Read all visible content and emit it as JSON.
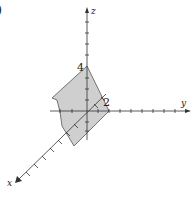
{
  "figure": {
    "partial_label": ")",
    "shape_fill": "#cfcfcf",
    "shape_stroke": "#555555",
    "axis_color": "#333333",
    "axes": {
      "x": {
        "label": "x"
      },
      "y": {
        "label": "y"
      },
      "z": {
        "label": "z"
      }
    },
    "annotations": {
      "z_intercept": "4",
      "y_intercept": "2"
    },
    "shape": {
      "description": "Shaded planar region in first octant-style 3D plot, vertices on z-axis at 4 and y-axis at 2",
      "vertices_px": [
        [
          87,
          66
        ],
        [
          52,
          98
        ],
        [
          57,
          100
        ],
        [
          60,
          112
        ],
        [
          62,
          126
        ],
        [
          74,
          146
        ],
        [
          109,
          111
        ]
      ]
    }
  }
}
